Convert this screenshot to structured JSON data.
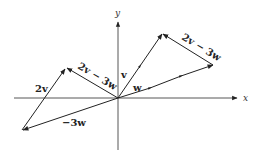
{
  "diagram": {
    "title": "",
    "axes": {
      "x_label": "x",
      "y_label": "y",
      "origin": [
        118,
        98
      ]
    },
    "vectors": [
      {
        "name": "v",
        "label": "v",
        "from": [
          118,
          98
        ],
        "to": [
          140,
          66
        ]
      },
      {
        "name": "w",
        "label": "w",
        "from": [
          118,
          98
        ],
        "to": [
          150,
          88
        ]
      },
      {
        "name": "2v",
        "label": "2v",
        "from": [
          22,
          130
        ],
        "to": [
          66,
          68
        ]
      },
      {
        "name": "-3w",
        "label": "−3w",
        "from": [
          118,
          98
        ],
        "to": [
          22,
          130
        ]
      },
      {
        "name": "2v-3w-left",
        "label": "2v − 3w",
        "from": [
          118,
          98
        ],
        "to": [
          66,
          68
        ]
      },
      {
        "name": "2v-3w-right",
        "label": "2v − 3w",
        "from": [
          213,
          65
        ],
        "to": [
          162,
          34
        ]
      }
    ],
    "labels": {
      "v": "v",
      "w": "w",
      "two_v": "2v",
      "neg_three_w": "−3w",
      "two_v_minus_three_w_left": "2v − 3w",
      "two_v_minus_three_w_right": "2v − 3w",
      "x": "x",
      "y": "y"
    },
    "colors": {
      "line": "#222222",
      "axis": "#444444"
    }
  }
}
